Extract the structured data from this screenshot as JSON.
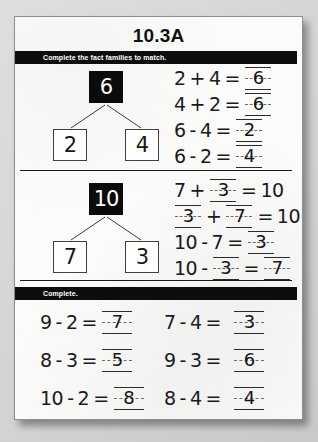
{
  "page": {
    "title": "10.3A"
  },
  "sections": [
    {
      "instruction": "Complete the fact families to match.",
      "bond": {
        "whole": "6",
        "part_left": "2",
        "part_right": "4"
      },
      "equations": [
        {
          "a": "2",
          "op": "+",
          "b": "4",
          "eq": "=",
          "answer": "6",
          "answer_pos": "result"
        },
        {
          "a": "4",
          "op": "+",
          "b": "2",
          "eq": "=",
          "answer": "6",
          "answer_pos": "result"
        },
        {
          "a": "6",
          "op": "-",
          "b": "4",
          "eq": "=",
          "answer": "2",
          "answer_pos": "result"
        },
        {
          "a": "6",
          "op": "-",
          "b": "2",
          "eq": "=",
          "answer": "4",
          "answer_pos": "result"
        }
      ]
    },
    {
      "bond": {
        "whole": "10",
        "part_left": "7",
        "part_right": "3"
      },
      "equations": [
        {
          "a": "7",
          "op": "+",
          "blank_b": "3",
          "eq": "=",
          "result": "10",
          "answer_pos": "b"
        },
        {
          "blank_a": "3",
          "op": "+",
          "blank_b": "7",
          "eq": "=",
          "result": "10",
          "answer_pos": "a_and_b"
        },
        {
          "a": "10",
          "op": "-",
          "b": "7",
          "eq": "=",
          "answer": "3",
          "answer_pos": "result"
        },
        {
          "a": "10",
          "op": "-",
          "blank_b": "3",
          "eq": "=",
          "answer": "7",
          "answer_pos": "b_and_result"
        }
      ]
    }
  ],
  "practice": {
    "instruction": "Complete.",
    "rows": [
      {
        "left": {
          "a": "9",
          "op": "-",
          "b": "2",
          "eq": "=",
          "answer": "7"
        },
        "right": {
          "a": "7",
          "op": "-",
          "b": "4",
          "eq": "=",
          "answer": "3"
        }
      },
      {
        "left": {
          "a": "8",
          "op": "-",
          "b": "3",
          "eq": "=",
          "answer": "5"
        },
        "right": {
          "a": "9",
          "op": "-",
          "b": "3",
          "eq": "=",
          "answer": "6"
        }
      },
      {
        "left": {
          "a": "10",
          "op": "-",
          "b": "2",
          "eq": "=",
          "answer": "8"
        },
        "right": {
          "a": "8",
          "op": "-",
          "b": "4",
          "eq": "=",
          "answer": "4"
        }
      }
    ]
  },
  "colors": {
    "paper": "#fbfbfa",
    "ink": "#1a1a1a",
    "bar": "#0d0d0d",
    "bar_text": "#ffffff",
    "backdrop": "#d8d8d8"
  }
}
